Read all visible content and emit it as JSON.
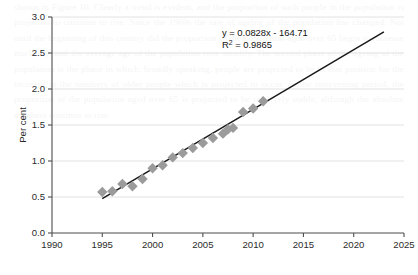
{
  "page": {
    "background_color": "#ffffff",
    "bleed_text": "shown in Figure 10. Clearly a trend is evident, and the proportion of such people in the population is projected to continue to rise. Since the 1960s the rate of ageing of the population has changed. Not until the beginning of this century did the proportion of the population aged over 65 begin to increase markedly, and the average age of the population rose steadily. The second phase of the ageing of the population is the phase in which, broadly speaking, people are projected to be in that position for the increase in the numbers of older people which is projected to occur. In the intervening period, the proportion of the population aged over 65 is projected to be relatively stable, although the absolute numbers continue to rise."
  },
  "chart_data": {
    "type": "scatter",
    "title": "",
    "xlabel": "",
    "ylabel": "Per cent",
    "xlim": [
      1990,
      2025
    ],
    "ylim": [
      0.0,
      3.0
    ],
    "xticks": [
      1990,
      1995,
      2000,
      2005,
      2010,
      2015,
      2020,
      2025
    ],
    "xtick_labels": [
      "1990",
      "1995",
      "2000",
      "2005",
      "2010",
      "2015",
      "2020",
      "2025"
    ],
    "yticks": [
      0.0,
      0.5,
      1.0,
      1.5,
      2.0,
      2.5,
      3.0
    ],
    "ytick_labels": [
      "0.0",
      "0.5",
      "1.0",
      "1.5",
      "2.0",
      "2.5",
      "3.0"
    ],
    "grid": "horizontal",
    "legend": "none",
    "marker": {
      "shape": "diamond",
      "color": "#9b9b9b",
      "size": 5.2
    },
    "x": [
      1995,
      1996,
      1997,
      1998,
      1999,
      2000,
      2001,
      2002,
      2003,
      2004,
      2005,
      2006,
      2007,
      2007.5,
      2008,
      2009,
      2010,
      2011
    ],
    "y": [
      0.57,
      0.58,
      0.68,
      0.65,
      0.75,
      0.9,
      0.94,
      1.05,
      1.11,
      1.18,
      1.25,
      1.32,
      1.38,
      1.44,
      1.46,
      1.68,
      1.73,
      1.83
    ],
    "points": [
      {
        "x": 1995,
        "y": 0.57
      },
      {
        "x": 1996,
        "y": 0.58
      },
      {
        "x": 1997,
        "y": 0.68
      },
      {
        "x": 1998,
        "y": 0.65
      },
      {
        "x": 1999,
        "y": 0.75
      },
      {
        "x": 2000,
        "y": 0.9
      },
      {
        "x": 2001,
        "y": 0.94
      },
      {
        "x": 2002,
        "y": 1.05
      },
      {
        "x": 2003,
        "y": 1.11
      },
      {
        "x": 2004,
        "y": 1.18
      },
      {
        "x": 2005,
        "y": 1.25
      },
      {
        "x": 2006,
        "y": 1.32
      },
      {
        "x": 2007,
        "y": 1.38
      },
      {
        "x": 2007.5,
        "y": 1.44
      },
      {
        "x": 2008,
        "y": 1.46
      },
      {
        "x": 2009,
        "y": 1.68
      },
      {
        "x": 2010,
        "y": 1.73
      },
      {
        "x": 2011,
        "y": 1.83
      }
    ],
    "trendline": {
      "type": "linear",
      "slope": 0.0828,
      "intercept": -164.71,
      "x_start": 1995,
      "x_end": 2023,
      "color": "#1a1a1a"
    },
    "annotations": {
      "equation": "y = 0.0828x - 164.71",
      "r_squared_label": "R",
      "r_squared_sup": "2",
      "r_squared_value": " = 0.9865"
    }
  }
}
